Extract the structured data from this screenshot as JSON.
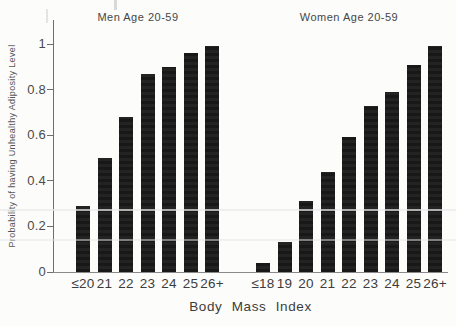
{
  "figure": {
    "ylabel": "Probability of having Unhealthy Adiposity Level",
    "xlabel": "Body Mass Index",
    "y_axis": {
      "tick_values": [
        0,
        0.2,
        0.4,
        0.6,
        0.8,
        1
      ],
      "tick_labels": [
        "0",
        "0.2",
        "0.4",
        "0.6",
        "0.8",
        "1"
      ]
    },
    "colors": {
      "bar": "#1b1b1b",
      "axis": "#6e6e6e",
      "text": "#3d3d3d",
      "background": "#fcfcfa"
    }
  },
  "chart_data": [
    {
      "type": "bar",
      "title": "Men Age 20-59",
      "categories": [
        "≤20",
        "21",
        "22",
        "23",
        "24",
        "25",
        "26+"
      ],
      "values": [
        0.29,
        0.5,
        0.68,
        0.87,
        0.9,
        0.96,
        0.99
      ],
      "xlabel": "Body Mass Index",
      "ylabel": "Probability of having Unhealthy Adiposity Level",
      "ylim": [
        0,
        1
      ],
      "grid": false,
      "legend": "none"
    },
    {
      "type": "bar",
      "title": "Women Age 20-59",
      "categories": [
        "≤18",
        "19",
        "20",
        "21",
        "22",
        "23",
        "24",
        "25",
        "26+"
      ],
      "values": [
        0.04,
        0.13,
        0.31,
        0.44,
        0.59,
        0.73,
        0.79,
        0.91,
        0.99
      ],
      "xlabel": "Body Mass Index",
      "ylabel": "Probability of having Unhealthy Adiposity Level",
      "ylim": [
        0,
        1
      ],
      "grid": false,
      "legend": "none"
    }
  ]
}
